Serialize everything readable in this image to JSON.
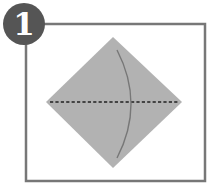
{
  "diagram": {
    "type": "origami-step",
    "step": {
      "number": "1",
      "badge_color": "#555555",
      "number_color": "#ffffff"
    },
    "frame": {
      "x": 26,
      "y": 24,
      "width": 179,
      "height": 157,
      "stroke": "#777777",
      "stroke_width": 2.5
    },
    "paper": {
      "shape": "diamond",
      "top": [
        113,
        37
      ],
      "right": [
        182,
        102
      ],
      "bottom": [
        113,
        168
      ],
      "left": [
        46,
        102
      ],
      "fill": "#b2b2b2"
    },
    "fold_line": {
      "style": "valley-dashed",
      "x1": 50,
      "y1": 102,
      "x2": 178,
      "y2": 102,
      "color": "#444444"
    },
    "fold_arrow": {
      "style": "arc",
      "start": [
        117,
        50
      ],
      "control": [
        145,
        104
      ],
      "end": [
        117,
        158
      ],
      "color": "#777777"
    }
  }
}
